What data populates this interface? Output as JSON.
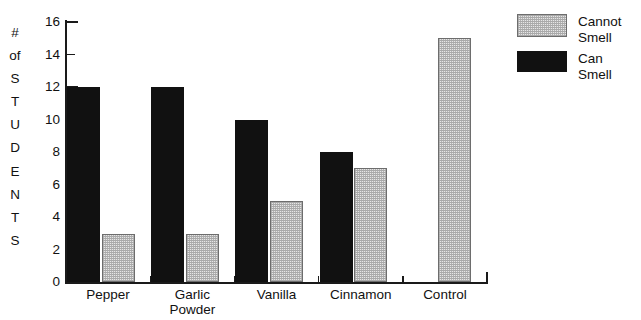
{
  "chart_data": {
    "type": "bar",
    "title": "",
    "subtitle": "",
    "xlabel": "",
    "ylabel": "# of STUDENTS",
    "ylabel_letters": [
      "#",
      "of",
      "S",
      "T",
      "U",
      "D",
      "E",
      "N",
      "T",
      "S"
    ],
    "categories": [
      "Pepper",
      "Garlic Powder",
      "Vanilla",
      "Cinnamon",
      "Control"
    ],
    "category_lines": [
      [
        "Pepper"
      ],
      [
        "Garlic",
        "Powder"
      ],
      [
        "Vanilla"
      ],
      [
        "Cinnamon"
      ],
      [
        "Control"
      ]
    ],
    "series": [
      {
        "name": "Can Smell",
        "values": [
          12,
          12,
          10,
          8,
          0
        ],
        "color": "#111111"
      },
      {
        "name": "Cannot Smell",
        "values": [
          3,
          3,
          5,
          7,
          15
        ],
        "color": "#c8c8c8"
      }
    ],
    "ylim": [
      0,
      16
    ],
    "yticks": [
      0,
      2,
      4,
      6,
      8,
      10,
      12,
      14,
      16
    ],
    "ytick_labels": [
      "0",
      "2",
      "4",
      "6",
      "8",
      "10",
      "12",
      "14",
      "16"
    ],
    "grid": false,
    "legend_position": "top-right"
  },
  "legend": {
    "items": [
      {
        "label": "Cannot\nSmell",
        "swatch": "cannot-smell-swatch"
      },
      {
        "label": "Can Smell",
        "swatch": "can-smell-swatch"
      }
    ]
  },
  "colors": {
    "axis": "#1a1a1a",
    "can_smell": "#111111",
    "cannot_smell_fill": "#c8c8c8",
    "cannot_smell_border": "#6d6d6d",
    "background": "#ffffff"
  }
}
